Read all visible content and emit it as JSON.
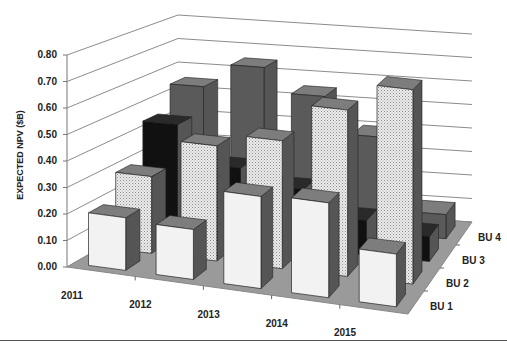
{
  "chart_data": {
    "type": "bar",
    "subtype": "3d-column",
    "title": "",
    "xlabel": "",
    "ylabel": "EXPECTED NPV ($B)",
    "ylim": [
      0,
      0.8
    ],
    "yticks": [
      "0.00",
      "0.10",
      "0.20",
      "0.30",
      "0.40",
      "0.50",
      "0.60",
      "0.70",
      "0.80"
    ],
    "categories": [
      "2011",
      "2012",
      "2013",
      "2014",
      "2015"
    ],
    "depth_labels": [
      "BU 1",
      "BU 2",
      "BU 3",
      "BU 4"
    ],
    "grid": true,
    "legend": "none (series labeled along depth axis)",
    "series": [
      {
        "name": "BU 1",
        "values": [
          0.2,
          0.19,
          0.35,
          0.36,
          0.2
        ],
        "fill": "#f2f2f2",
        "pattern": "solid-light"
      },
      {
        "name": "BU 2",
        "values": [
          0.3,
          0.45,
          0.5,
          0.65,
          0.76
        ],
        "fill": "#e0e0e0",
        "pattern": "dotted"
      },
      {
        "name": "BU 3",
        "values": [
          0.45,
          0.3,
          0.24,
          0.14,
          0.1
        ],
        "fill": "#111111",
        "pattern": "solid-black"
      },
      {
        "name": "BU 4",
        "values": [
          0.55,
          0.65,
          0.55,
          0.4,
          0.1
        ],
        "fill": "#5a5a5a",
        "pattern": "solid-dark-gray"
      }
    ]
  },
  "colors": {
    "floor": "#9a9a9a",
    "gridline": "#8c8c8c",
    "side_shade": "#555555",
    "text": "#222222"
  },
  "caption": {
    "text_clipped": "cropped caption (text not legible)"
  }
}
